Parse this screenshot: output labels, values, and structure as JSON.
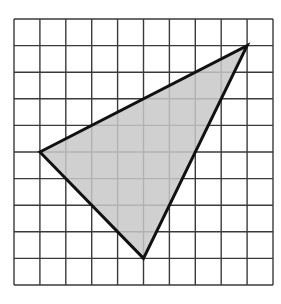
{
  "diagram": {
    "type": "grid-triangle",
    "grid": {
      "columns": 10,
      "rows": 10
    },
    "triangle": {
      "vertices": [
        {
          "name": "left-vertex",
          "col": 1,
          "row": 5
        },
        {
          "name": "top-right-vertex",
          "col": 9,
          "row": 1
        },
        {
          "name": "bottom-vertex",
          "col": 5,
          "row": 9
        }
      ],
      "fill_color": "#c8c8c8",
      "stroke_color": "#111111"
    },
    "grid_line_color": "#3a3a3a",
    "background_color": "#ffffff"
  }
}
